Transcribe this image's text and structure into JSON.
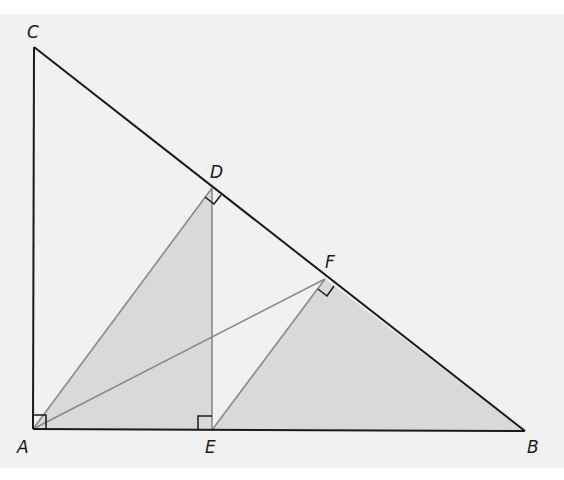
{
  "diagram": {
    "type": "geometry-right-triangle-altitudes",
    "background_color": "#f1f1f1",
    "shade_color": "#d9d9d9",
    "main_line_color": "#1a1a1a",
    "aux_line_color": "#8a8a8a",
    "points": {
      "A": {
        "label": "A",
        "x": 33,
        "y": 429
      },
      "B": {
        "label": "B",
        "x": 525,
        "y": 431
      },
      "C": {
        "label": "C",
        "x": 34,
        "y": 47
      },
      "D": {
        "label": "D",
        "x": 212,
        "y": 188
      },
      "E": {
        "label": "E",
        "x": 212,
        "y": 430
      },
      "F": {
        "label": "F",
        "x": 325,
        "y": 279
      }
    },
    "labels": {
      "A": "A",
      "B": "B",
      "C": "C",
      "D": "D",
      "E": "E",
      "F": "F"
    },
    "segments": [
      {
        "from": "A",
        "to": "C",
        "style": "main"
      },
      {
        "from": "C",
        "to": "B",
        "style": "main"
      },
      {
        "from": "A",
        "to": "B",
        "style": "main"
      },
      {
        "from": "A",
        "to": "D",
        "style": "aux"
      },
      {
        "from": "D",
        "to": "E",
        "style": "aux"
      },
      {
        "from": "A",
        "to": "F",
        "style": "aux"
      },
      {
        "from": "E",
        "to": "F",
        "style": "aux"
      }
    ],
    "shaded_regions": [
      {
        "name": "triangle-ADE",
        "vertices": [
          "A",
          "D",
          "E"
        ]
      },
      {
        "name": "triangle-EFB",
        "vertices": [
          "E",
          "F",
          "B"
        ]
      }
    ],
    "right_angles": [
      "A",
      "D",
      "E",
      "F"
    ]
  }
}
